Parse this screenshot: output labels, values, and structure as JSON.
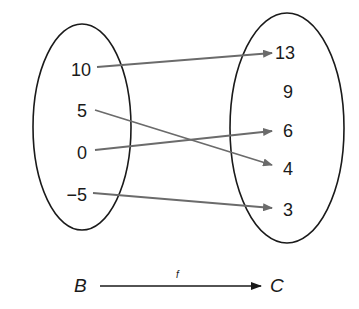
{
  "diagram": {
    "domain_set": {
      "name": "B",
      "elements": [
        "10",
        "5",
        "0",
        "−5"
      ]
    },
    "codomain_set": {
      "name": "C",
      "elements": [
        "13",
        "9",
        "6",
        "4",
        "3"
      ]
    },
    "mappings": [
      {
        "from": "10",
        "to": "13"
      },
      {
        "from": "5",
        "to": "4"
      },
      {
        "from": "0",
        "to": "6"
      },
      {
        "from": "−5",
        "to": "3"
      }
    ],
    "function_label": "f",
    "colors": {
      "ellipse_stroke": "#1a1a1a",
      "arrow": "#6b6b6b",
      "text": "#1a1a1a"
    }
  }
}
